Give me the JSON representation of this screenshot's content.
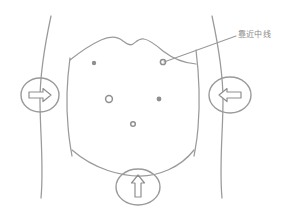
{
  "diagram": {
    "type": "anatomical-line-drawing",
    "background_color": "#ffffff",
    "stroke_color": "#9a9a9a",
    "marker_color": "#8f8f8f",
    "text_color": "#8a8a8a"
  },
  "annotations": [
    {
      "id": "midline-label",
      "text": "靠近中线",
      "meaning": "close to midline",
      "anchor_marker": "marker-upper-right",
      "leader_from": {
        "x": 163,
        "y": 62
      },
      "leader_to": {
        "x": 236,
        "y": 36
      }
    }
  ],
  "markers": [
    {
      "id": "marker-upper-left",
      "style": "filled-dot",
      "x": 94,
      "y": 63,
      "r": 2.2
    },
    {
      "id": "marker-upper-right",
      "style": "hollow-ring",
      "x": 163,
      "y": 62,
      "r": 3.0
    },
    {
      "id": "marker-mid-left",
      "style": "hollow-ring",
      "x": 109,
      "y": 99,
      "r": 3.6
    },
    {
      "id": "marker-mid-right",
      "style": "filled-dot",
      "x": 159,
      "y": 99,
      "r": 2.4
    },
    {
      "id": "marker-lower-center",
      "style": "hollow-ring",
      "x": 133,
      "y": 124,
      "r": 2.6
    }
  ],
  "direction_indicators": [
    {
      "id": "left-indicator",
      "icon": "arrow-right-icon",
      "direction": "right",
      "shape": "circle",
      "cx": 40,
      "cy": 95,
      "rx": 19,
      "ry": 17
    },
    {
      "id": "right-indicator",
      "icon": "arrow-left-icon",
      "direction": "left",
      "shape": "ellipse",
      "cx": 230,
      "cy": 95,
      "rx": 21,
      "ry": 18
    },
    {
      "id": "bottom-indicator",
      "icon": "arrow-up-icon",
      "direction": "up",
      "shape": "ellipse",
      "cx": 138,
      "cy": 187,
      "rx": 22,
      "ry": 18
    }
  ],
  "contours": [
    {
      "id": "left-body-outline",
      "description": "left flank curve"
    },
    {
      "id": "right-body-outline",
      "description": "right flank curve"
    },
    {
      "id": "costal-margin",
      "description": "wavy M-shaped rib cage contour"
    },
    {
      "id": "pelvic-curve",
      "description": "lower abdominal arc"
    }
  ]
}
